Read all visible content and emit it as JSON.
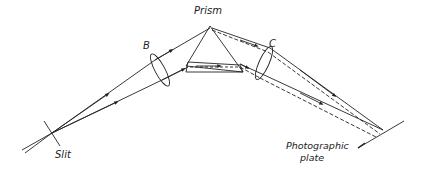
{
  "diagram": {
    "labels": {
      "prism": "Prism",
      "lens_b": "B",
      "lens_c": "C",
      "slit": "Slit",
      "plate_line1": "Photographic",
      "plate_line2": "plate"
    },
    "colors": {
      "ink": "#222222",
      "background": "#ffffff"
    }
  }
}
